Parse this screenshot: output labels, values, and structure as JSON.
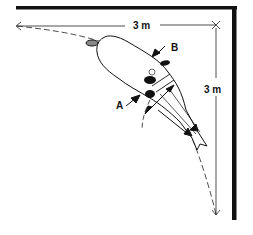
{
  "diagram": {
    "dimensions": {
      "horizontal": "3 m",
      "vertical": "3 m"
    },
    "labels": {
      "a": "A",
      "b": "B"
    },
    "colors": {
      "ink": "#111111",
      "background": "#ffffff"
    }
  }
}
